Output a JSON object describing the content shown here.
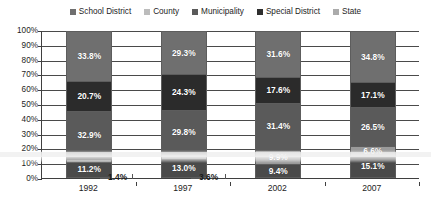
{
  "chart_data": {
    "type": "bar",
    "stacked": true,
    "stack_mode": "percent",
    "title": "",
    "xlabel": "",
    "ylabel": "",
    "ylim": [
      0,
      100
    ],
    "yticks": [
      "0%",
      "10%",
      "20%",
      "30%",
      "40%",
      "50%",
      "60%",
      "70%",
      "80%",
      "90%",
      "100%"
    ],
    "grid": true,
    "legend_position": "top",
    "categories": [
      "1992",
      "1997",
      "2002",
      "2007"
    ],
    "stack_order_bottom_to_top": [
      "State",
      "Special District",
      "Municipality",
      "County",
      "School District"
    ],
    "series": [
      {
        "name": "School District",
        "color": "#6f6f6f",
        "values": [
          33.8,
          29.3,
          31.6,
          34.8
        ]
      },
      {
        "name": "County",
        "color": "#2b2b2b",
        "values": [
          20.7,
          24.3,
          17.6,
          17.1
        ]
      },
      {
        "name": "Municipality",
        "color": "#5a5a5a",
        "values": [
          32.9,
          29.8,
          31.4,
          26.5
        ]
      },
      {
        "name": "Special District",
        "color": "#9a9a9a",
        "values": [
          1.4,
          3.6,
          9.9,
          6.5
        ]
      },
      {
        "name": "State",
        "color": "#4a4a4a",
        "values": [
          11.2,
          13.0,
          9.4,
          15.1
        ]
      }
    ],
    "data_labels": {
      "1992": {
        "School District": "33.8%",
        "County": "20.7%",
        "Municipality": "32.9%",
        "Special District": "1.4%",
        "State": "11.2%"
      },
      "1997": {
        "School District": "29.3%",
        "County": "24.3%",
        "Municipality": "29.8%",
        "Special District": "3.6%",
        "State": "13.0%"
      },
      "2002": {
        "School District": "31.6%",
        "County": "17.6%",
        "Municipality": "31.4%",
        "Special District": "9.9%",
        "State": "9.4%"
      },
      "2007": {
        "School District": "34.8%",
        "County": "17.1%",
        "Municipality": "26.5%",
        "Special District": "6.6%",
        "State": "15.1%"
      }
    },
    "callouts": [
      {
        "category": "1992",
        "series": "Special District",
        "label": "1.4%"
      },
      {
        "category": "1997",
        "series": "Special District",
        "label": "3.6%"
      }
    ]
  },
  "legend": {
    "items": [
      {
        "label": "School District",
        "color": "#6f6f6f"
      },
      {
        "label": "County",
        "color": "#b9b9b9"
      },
      {
        "label": "Municipality",
        "color": "#5a5a5a"
      },
      {
        "label": "Special District",
        "color": "#2f2f2f"
      },
      {
        "label": "State",
        "color": "#a8a8a8"
      }
    ]
  },
  "yaxis": {
    "ticks": [
      "100%",
      "90%",
      "80%",
      "70%",
      "60%",
      "50%",
      "40%",
      "30%",
      "20%",
      "10%",
      "0%"
    ]
  },
  "xaxis": {
    "ticks": [
      "1992",
      "1997",
      "2002",
      "2007"
    ]
  }
}
